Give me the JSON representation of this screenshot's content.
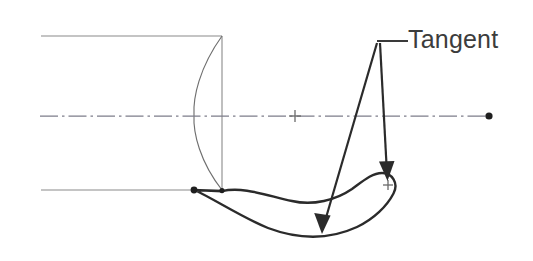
{
  "drawing": {
    "title": "Tangent construction detail",
    "canvas": {
      "width": 533,
      "height": 261,
      "background": "#ffffff"
    },
    "colors": {
      "thin_line": "#8a8a8a",
      "profile_arc": "#6f6f6f",
      "center_line": "#7d7d8a",
      "band_outline": "#2b2b2b",
      "band_fill": "#ffffff",
      "leader": "#2b2b2b",
      "text": "#3c3c3c",
      "marker": "#1f1f1f",
      "cross": "#6a6a6a"
    },
    "annotation": {
      "label": "Tangent",
      "label_x": 408,
      "label_y": 48,
      "shoulder_path": "M 377 41 L 408 41",
      "apex_x": 377,
      "apex_y": 41
    },
    "body_outline": {
      "top_line": "M 41 36 L 222 36",
      "bottom_line": "M 41 190 L 222 190",
      "right_vertical": "M 222 36 L 222 190",
      "dome_arc": "M 222 36 C 199 68 193 98 194 115 C 193 133 200 162 222 190"
    },
    "center_line": {
      "path": "M 40 116 L 495 116",
      "dash_pattern": "18 4 2.5 4",
      "cross_mark": {
        "x": 295,
        "y": 116,
        "size": 6
      },
      "end_dot": {
        "x": 489,
        "y": 116,
        "r": 3.6
      }
    },
    "tangent_band": {
      "outline_path": "M 194.5 190.0 C 214 199 243 218 268 228 C 300 240 331 239 357 227 C 374 219 387 206 393.5 193.5 C 399 183 392 173 382 173 C 372 173 363 181 352 189 C 336 200 313 206 292 201 C 268 196 243 186 222 191.2 Z",
      "inner_edge_hint": "M 222 191 C 248 186 272 197 292 201",
      "cap_center": {
        "x": 388,
        "y": 185
      },
      "cap_cross_size": 5,
      "tangent_point": {
        "x": 194,
        "y": 190,
        "r": 3.4
      },
      "corner_point": {
        "x": 222,
        "y": 190.6,
        "r": 2.6
      }
    },
    "arrows": [
      {
        "name": "arrow-to-outer-edge",
        "shaft": "M 377 43 L 323 228",
        "tip_x": 322,
        "tip_y": 234,
        "head_points": "322,234 314.2,213.0 330.6,215.6"
      },
      {
        "name": "arrow-to-cap-center",
        "shaft": "M 380 43 L 387 174",
        "tip_x": 387.5,
        "tip_y": 181,
        "head_points": "387.5,181 379.0,161.5 394.5,161.0"
      }
    ]
  }
}
